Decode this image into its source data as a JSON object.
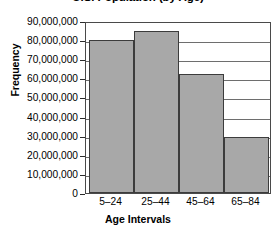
{
  "chart_data": {
    "type": "bar",
    "title": "U.S. Population (by Age)",
    "xlabel": "Age Intervals",
    "ylabel": "Frequency",
    "categories": [
      "5–24",
      "25–44",
      "45–64",
      "65–84"
    ],
    "values": [
      80000000,
      85000000,
      62500000,
      29500000
    ],
    "ylim": [
      0,
      90000000
    ],
    "ytick_labels": [
      "90,000,000",
      "80,000,000",
      "70,000,000",
      "60,000,000",
      "50,000,000",
      "40,000,000",
      "30,000,000",
      "20,000,000",
      "10,000,000",
      "0"
    ],
    "ytick_values": [
      90000000,
      80000000,
      70000000,
      60000000,
      50000000,
      40000000,
      30000000,
      20000000,
      10000000,
      0
    ],
    "grid": true,
    "legend": false,
    "bar_color": "#a8a8a8",
    "bar_border_color": "#3c3c3c",
    "axis_color": "#4a4a4a",
    "grid_color": "#6e6e6e",
    "title_cropped": true
  }
}
